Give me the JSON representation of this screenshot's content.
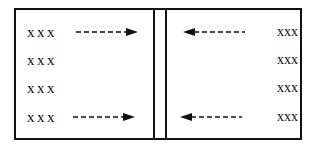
{
  "diagram": {
    "left_panel": {
      "rows": [
        {
          "label": "xxx",
          "arrow": "right"
        },
        {
          "label": "xxx",
          "arrow": null
        },
        {
          "label": "xxx",
          "arrow": null
        },
        {
          "label": "xxx",
          "arrow": "right"
        }
      ]
    },
    "right_panel": {
      "rows": [
        {
          "label": "xxx",
          "arrow": "left"
        },
        {
          "label": "xxx",
          "arrow": null
        },
        {
          "label": "xxx",
          "arrow": null
        },
        {
          "label": "xxx",
          "arrow": "left"
        }
      ]
    },
    "divider": "double-vertical-line",
    "colors": {
      "line": "#111111",
      "background": "#ffffff",
      "text": "#111111"
    }
  }
}
